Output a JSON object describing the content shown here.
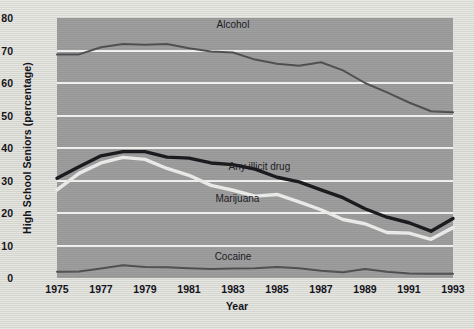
{
  "chart_data": {
    "type": "line",
    "title": "",
    "xlabel": "Year",
    "ylabel": "High School Seniors (percentage)",
    "xlim": [
      1975,
      1993
    ],
    "ylim": [
      0,
      80
    ],
    "yticks": [
      0,
      10,
      20,
      30,
      40,
      50,
      60,
      70,
      80
    ],
    "xticks": [
      1975,
      1977,
      1979,
      1981,
      1983,
      1985,
      1987,
      1989,
      1991,
      1993
    ],
    "grid": "horizontal",
    "legend": "inline-annotations",
    "x": [
      1975,
      1976,
      1977,
      1978,
      1979,
      1980,
      1981,
      1982,
      1983,
      1984,
      1985,
      1986,
      1987,
      1988,
      1989,
      1990,
      1991,
      1992,
      1993
    ],
    "series": [
      {
        "name": "Alcohol",
        "color": "#4e4e52",
        "style": "dark-thin",
        "values": [
          68.8,
          68.8,
          71.0,
          72.0,
          71.8,
          72.0,
          70.7,
          69.7,
          69.4,
          67.2,
          65.9,
          65.3,
          66.4,
          63.9,
          60.0,
          57.1,
          54.0,
          51.3,
          51.0
        ]
      },
      {
        "name": "Any illicit drug",
        "color": "#17171b",
        "style": "dark-thick",
        "values": [
          30.7,
          34.2,
          37.6,
          38.9,
          38.9,
          37.2,
          36.9,
          35.4,
          34.9,
          33.5,
          31.0,
          29.6,
          27.1,
          24.7,
          21.3,
          18.7,
          17.0,
          14.4,
          18.3
        ]
      },
      {
        "name": "Marijuana",
        "color": "#ececea",
        "style": "light-thick",
        "values": [
          27.1,
          32.2,
          35.4,
          37.1,
          36.5,
          33.7,
          31.6,
          28.5,
          27.0,
          25.2,
          25.7,
          23.4,
          21.0,
          18.0,
          16.7,
          14.0,
          13.8,
          11.9,
          15.5
        ]
      },
      {
        "name": "Cocaine",
        "color": "#4e4e52",
        "style": "dark-thin",
        "values": [
          1.9,
          2.0,
          2.9,
          3.9,
          3.4,
          3.3,
          3.0,
          2.8,
          2.9,
          3.0,
          3.4,
          3.0,
          2.2,
          1.8,
          2.8,
          1.9,
          1.4,
          1.3,
          1.3
        ]
      }
    ],
    "annotations": [
      {
        "text": "Alcohol",
        "x": 1983.0,
        "y": 77.5
      },
      {
        "text": "Any illicit drug",
        "x": 1984.2,
        "y": 34.0
      },
      {
        "text": "Marijuana",
        "x": 1983.2,
        "y": 24.0
      },
      {
        "text": "Cocaine",
        "x": 1983.0,
        "y": 6.2
      }
    ],
    "colors": {
      "plot_background": "#9b9b9b",
      "page_background": "#d9d9d4",
      "gridline": "#f2f2f0",
      "dark_line": "#17171b",
      "thin_line": "#4e4e52",
      "light_line": "#ececea",
      "text": "#14141a"
    }
  }
}
